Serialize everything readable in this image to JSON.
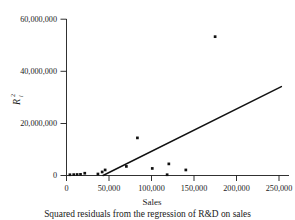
{
  "chart_data": {
    "type": "scatter",
    "title": "",
    "caption": "Squared residuals from the regression of R&D on sales",
    "xlabel": "Sales",
    "ylabel": "R",
    "ylabel_superscript": "2",
    "ylabel_subscript": "i",
    "xlim": [
      0,
      262000
    ],
    "ylim": [
      0,
      62000000
    ],
    "grid": false,
    "legend": "none",
    "xticks": [
      0,
      50000,
      100000,
      150000,
      200000,
      250000
    ],
    "xtick_labels": [
      "0",
      "50,000",
      "100,000",
      "150,000",
      "200,000",
      "250,000"
    ],
    "yticks": [
      0,
      20000000,
      40000000,
      60000000
    ],
    "ytick_labels": [
      "0",
      "20,000,000",
      "40,000,000",
      "60,000,000"
    ],
    "points": [
      {
        "x": 4000,
        "y": 300000
      },
      {
        "x": 8500,
        "y": 350000
      },
      {
        "x": 12500,
        "y": 400000
      },
      {
        "x": 16500,
        "y": 450000
      },
      {
        "x": 21500,
        "y": 900000
      },
      {
        "x": 37000,
        "y": 600000
      },
      {
        "x": 42000,
        "y": 1400000
      },
      {
        "x": 45500,
        "y": 2200000
      },
      {
        "x": 70500,
        "y": 3600000
      },
      {
        "x": 83500,
        "y": 14900000
      },
      {
        "x": 101000,
        "y": 2800000
      },
      {
        "x": 118500,
        "y": 300000
      },
      {
        "x": 120500,
        "y": 4600000
      },
      {
        "x": 140500,
        "y": 2200000
      },
      {
        "x": 175000,
        "y": 55000000
      }
    ],
    "regression_line": {
      "label": "fitted line",
      "x_start": 43000,
      "y_start": 0,
      "x_end": 253000,
      "y_end": 35200000
    }
  }
}
